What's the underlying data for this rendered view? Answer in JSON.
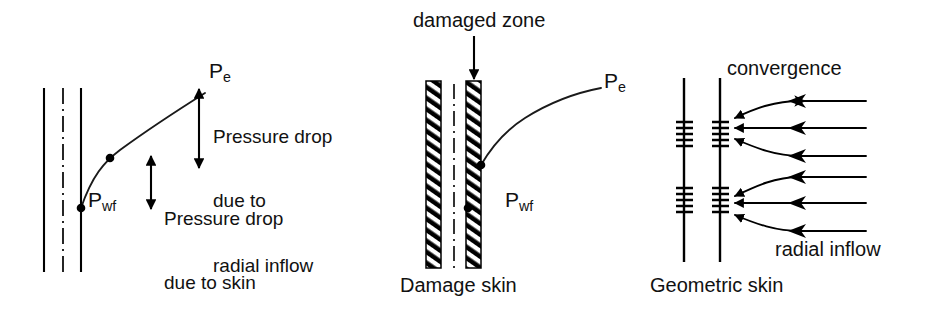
{
  "figure": {
    "title_present": false,
    "background_color": "#ffffff",
    "ink_color": "#000000",
    "panels": [
      {
        "id": "radial-inflow-panel",
        "caption": "",
        "labels": {
          "pe": "P",
          "pe_sub": "e",
          "pwf": "P",
          "pwf_sub": "wf",
          "annotation_radial": "Pressure drop\ndue to\nradial inflow",
          "annotation_skin": "Pressure drop\ndue to skin"
        }
      },
      {
        "id": "damage-skin-panel",
        "caption": "Damage skin",
        "labels": {
          "damaged_zone": "damaged zone",
          "pe": "P",
          "pe_sub": "e",
          "pwf": "P",
          "pwf_sub": "wf"
        }
      },
      {
        "id": "geometric-skin-panel",
        "caption": "Geometric skin",
        "labels": {
          "convergence": "convergence",
          "radial_inflow": "radial inflow"
        }
      }
    ],
    "annotations": {
      "radial_line1": "Pressure drop",
      "radial_line2": "due to",
      "radial_line3": "radial inflow",
      "skin_line1": "Pressure drop",
      "skin_line2": "due to skin"
    }
  }
}
